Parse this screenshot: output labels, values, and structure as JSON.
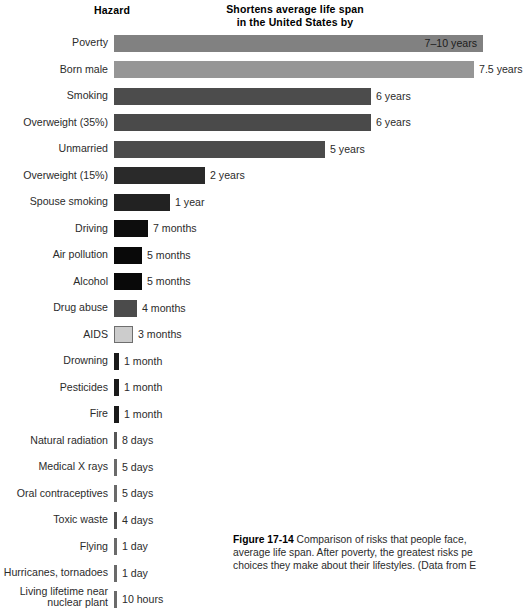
{
  "headers": {
    "hazard": "Hazard",
    "value_line1": "Shortens average life span",
    "value_line2": "in the United States by"
  },
  "caption": {
    "figure_label": "Figure 17-14",
    "text": " Comparison of risks that people face, average life span. After poverty, the greatest risks pe choices they make about their lifestyles. (Data from E"
  },
  "chart_data": {
    "type": "bar",
    "title": "Shortens average life span in the United States by",
    "xlabel": "",
    "ylabel": "Hazard",
    "grid": false,
    "legend": "none",
    "orientation": "horizontal",
    "value_unit": "life span shortened",
    "categories": [
      "Poverty",
      "Born male",
      "Smoking",
      "Overweight (35%)",
      "Unmarried",
      "Overweight (15%)",
      "Spouse smoking",
      "Driving",
      "Air pollution",
      "Alcohol",
      "Drug abuse",
      "AIDS",
      "Drowning",
      "Pesticides",
      "Fire",
      "Natural radiation",
      "Medical X rays",
      "Oral contraceptives",
      "Toxic waste",
      "Flying",
      "Hurricanes, tornadoes",
      "Living lifetime near\nnuclear plant"
    ],
    "value_labels": [
      "7–10 years",
      "7.5 years",
      "6 years",
      "6 years",
      "5 years",
      "2 years",
      "1 year",
      "7 months",
      "5 months",
      "5 months",
      "4 months",
      "3 months",
      "1 month",
      "1 month",
      "1 month",
      "8 days",
      "5 days",
      "5 days",
      "4 days",
      "1 day",
      "1 day",
      "10 hours"
    ],
    "values_days": [
      3103,
      2738,
      2190,
      2190,
      1825,
      730,
      365,
      213,
      152,
      152,
      122,
      91,
      30,
      30,
      30,
      8,
      5,
      5,
      4,
      1,
      1,
      0.42
    ],
    "bar_px": [
      369,
      360,
      257,
      257,
      211,
      91,
      56,
      34,
      28,
      28,
      23,
      19,
      5,
      5,
      5,
      3,
      3,
      3,
      3,
      3,
      3,
      3
    ],
    "bar_colors": [
      "#818181",
      "#969696",
      "#4c4c4c",
      "#4a4a4a",
      "#4b4b4b",
      "#2a2a2a",
      "#222222",
      "#0d0d0d",
      "#090909",
      "#090909",
      "#4b4b4b",
      "#cccccc",
      "#1a1a1a",
      "#1a1a1a",
      "#1a1a1a",
      "#565656",
      "#6a6a6a",
      "#6a6a6a",
      "#4f4f4f",
      "#6a6a6a",
      "#6a6a6a",
      "#6a6a6a"
    ],
    "label_inside": [
      true,
      false,
      false,
      false,
      false,
      false,
      false,
      false,
      false,
      false,
      false,
      false,
      false,
      false,
      false,
      false,
      false,
      false,
      false,
      false,
      false,
      false
    ],
    "outlined": [
      false,
      false,
      false,
      false,
      false,
      false,
      false,
      false,
      false,
      false,
      false,
      true,
      false,
      false,
      false,
      false,
      false,
      false,
      false,
      false,
      false,
      false
    ]
  }
}
